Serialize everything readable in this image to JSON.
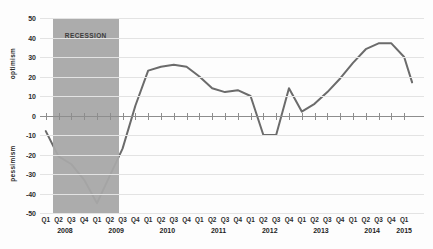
{
  "chart_data": {
    "type": "line",
    "title": "",
    "xlabel": "",
    "ylabel_top": "optimism",
    "ylabel_bottom": "pessimism",
    "ylim": [
      -50,
      50
    ],
    "ytick_labels": [
      "50",
      "40",
      "30",
      "20",
      "10",
      "0",
      "-10",
      "-20",
      "-30",
      "-40",
      "-50"
    ],
    "ytick_values": [
      50,
      40,
      30,
      20,
      10,
      0,
      -10,
      -20,
      -30,
      -40,
      -50
    ],
    "grid": true,
    "legend": "none",
    "line_color": "#6b6b6b",
    "annotation": {
      "label": "RECESSION",
      "band_color": "#a8a8a8",
      "start_category": "2008 Q2",
      "end_category": "2009 Q2"
    },
    "categories": [
      "Q1",
      "Q2",
      "Q3",
      "Q4",
      "Q1",
      "Q2",
      "Q3",
      "Q4",
      "Q1",
      "Q2",
      "Q3",
      "Q4",
      "Q1",
      "Q2",
      "Q3",
      "Q4",
      "Q1",
      "Q2",
      "Q3",
      "Q4",
      "Q1",
      "Q2",
      "Q3",
      "Q4",
      "Q1",
      "Q2",
      "Q3",
      "Q4",
      "Q1"
    ],
    "years": [
      {
        "label": "2008",
        "first_index": 0,
        "last_index": 3
      },
      {
        "label": "2009",
        "first_index": 4,
        "last_index": 7
      },
      {
        "label": "2010",
        "first_index": 8,
        "last_index": 11
      },
      {
        "label": "2011",
        "first_index": 12,
        "last_index": 15
      },
      {
        "label": "2012",
        "first_index": 16,
        "last_index": 19
      },
      {
        "label": "2013",
        "first_index": 20,
        "last_index": 23
      },
      {
        "label": "2014",
        "first_index": 24,
        "last_index": 27
      },
      {
        "label": "2015",
        "first_index": 28,
        "last_index": 28
      }
    ],
    "values": [
      -8,
      -21,
      -25,
      -33,
      -45,
      -31,
      -17,
      5,
      23,
      25,
      26,
      25,
      20,
      14,
      12,
      13,
      10,
      -10,
      -10,
      14,
      2,
      6,
      12,
      19,
      27,
      34,
      37,
      37,
      30
    ],
    "last_point_value": 17
  },
  "figure": {
    "background": "#fdfdfd",
    "gridline_color": "#e3e3e3",
    "axis_color": "#8d8d8d"
  }
}
